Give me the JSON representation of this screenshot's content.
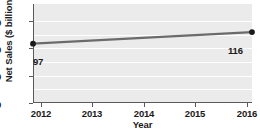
{
  "chart_data": {
    "type": "line",
    "title": "",
    "xlabel": "Year",
    "ylabel": "Net Sales ($ billions)",
    "x": [
      2012,
      2016
    ],
    "values": [
      97,
      116
    ],
    "categories": [
      "2012",
      "2016"
    ],
    "point_labels": [
      "97",
      "116"
    ],
    "xticks": [
      "2012",
      "2013",
      "2014",
      "2015",
      "2016"
    ],
    "xlim": [
      2012,
      2016
    ],
    "yticks": [
      "0",
      "50",
      "100",
      "150"
    ],
    "ylim": [
      0,
      162
    ],
    "grid": "horizontal",
    "legend": "none",
    "series": [
      {
        "name": "Net Sales",
        "values": [
          97,
          116
        ]
      }
    ],
    "colors": {
      "plot_background": "#ebebeb",
      "gridline": "#ffffff",
      "axis": "#5a5a5a",
      "line": "#6b6b6b",
      "marker": "#1a1a1a",
      "text": "#1a1a1a"
    }
  }
}
